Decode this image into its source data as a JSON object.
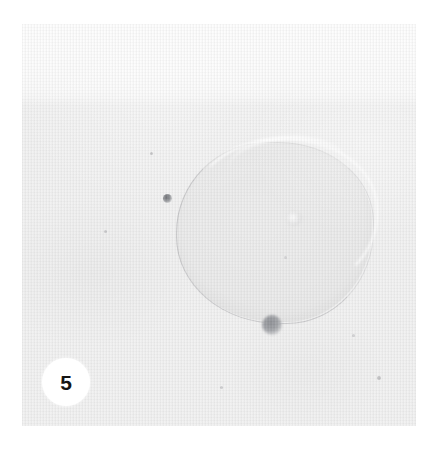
{
  "figure": {
    "panel_label": "5",
    "caption": "",
    "background_color": "#ffffff"
  },
  "photo": {
    "plate_color": "#f1f1f1",
    "upper_band_color": "#fcfcfc",
    "texture": "fine-vertical-weave"
  },
  "specimen": {
    "blob": {
      "name": "translucent-droplet",
      "fill_color": "#ebebec",
      "outline_color": "#787a7d",
      "highlight_color": "#ffffff",
      "inner_spot_color": "#d2d2d4"
    },
    "particles": [
      {
        "name": "small-dark-particle",
        "color": "#6f7176",
        "diameter_px": 9
      },
      {
        "name": "large-grey-particle",
        "color": "#8e9095",
        "diameter_px": 20
      }
    ],
    "specks": [
      {
        "color": "#c9c9cb"
      },
      {
        "color": "#cfcfd1"
      },
      {
        "color": "#c4c4c6"
      },
      {
        "color": "#cdcdcf"
      },
      {
        "color": "#c8c8ca"
      }
    ]
  }
}
